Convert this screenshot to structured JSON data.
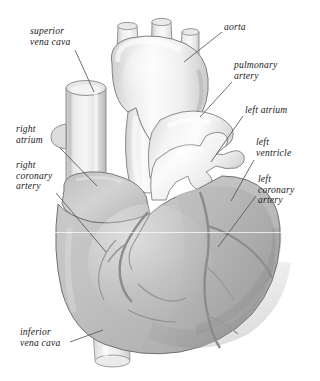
{
  "figure": {
    "view": "anterior",
    "style": "grayscale airbrush medical illustration",
    "background_color": "#ffffff",
    "label_color": "#1b1b1b",
    "leader_line_color": "#55555a"
  },
  "palette": {
    "background": "#ffffff",
    "vessel_highlight": "#fdfdfd",
    "vessel_light": "#f2f2f2",
    "vessel_mid": "#dcdcdc",
    "vessel_shadow": "#bdbdbd",
    "myocardium_light": "#cfcfcf",
    "myocardium_mid": "#bcbcbc",
    "myocardium_dark": "#a4a4a4",
    "outline": "#6f6f73",
    "groove": "#8f8f93"
  },
  "labels": [
    {
      "id": "superior-vena-cava",
      "lines": [
        "superior",
        "vena cava"
      ],
      "text": "superior vena cava",
      "side": "left",
      "x": 30,
      "y": 26,
      "leader": {
        "x1": 75,
        "y1": 50,
        "x2": 94,
        "y2": 92
      }
    },
    {
      "id": "right-atrium",
      "lines": [
        "right",
        "atrium"
      ],
      "text": "right atrium",
      "side": "left",
      "x": 16,
      "y": 124,
      "leader": {
        "x1": 60,
        "y1": 148,
        "x2": 97,
        "y2": 186
      }
    },
    {
      "id": "right-coronary-artery",
      "lines": [
        "right",
        "coronary",
        "artery"
      ],
      "text": "right coronary artery",
      "side": "left",
      "x": 16,
      "y": 160,
      "leader": {
        "x1": 56,
        "y1": 193,
        "x2": 106,
        "y2": 252
      }
    },
    {
      "id": "inferior-vena-cava",
      "lines": [
        "inferior",
        "vena cava"
      ],
      "text": "inferior vena cava",
      "side": "left",
      "x": 20,
      "y": 327,
      "leader": {
        "x1": 70,
        "y1": 342,
        "x2": 103,
        "y2": 330
      }
    },
    {
      "id": "aorta",
      "lines": [
        "aorta"
      ],
      "text": "aorta",
      "side": "right",
      "x": 224,
      "y": 22,
      "leader": {
        "x1": 222,
        "y1": 32,
        "x2": 184,
        "y2": 62
      }
    },
    {
      "id": "pulmonary-artery",
      "lines": [
        "pulmonary",
        "artery"
      ],
      "text": "pulmonary artery",
      "side": "right",
      "x": 234,
      "y": 60,
      "leader": {
        "x1": 232,
        "y1": 82,
        "x2": 200,
        "y2": 117
      }
    },
    {
      "id": "left-atrium",
      "lines": [
        "left atrium"
      ],
      "text": "left atrium",
      "side": "right",
      "x": 245,
      "y": 105,
      "leader": {
        "x1": 243,
        "y1": 116,
        "x2": 211,
        "y2": 162
      }
    },
    {
      "id": "left-ventricle",
      "lines": [
        "left",
        "ventricle"
      ],
      "text": "left ventricle",
      "side": "right",
      "x": 256,
      "y": 137,
      "leader": {
        "x1": 254,
        "y1": 160,
        "x2": 231,
        "y2": 201
      }
    },
    {
      "id": "left-coronary-artery",
      "lines": [
        "left",
        "coronary",
        "artery"
      ],
      "text": "left coronary artery",
      "side": "right",
      "x": 258,
      "y": 174,
      "leader": {
        "x1": 256,
        "y1": 196,
        "x2": 218,
        "y2": 247
      }
    }
  ],
  "structures": [
    {
      "id": "aortic-arch",
      "name": "aorta / aortic arch",
      "tone": "vessel_light"
    },
    {
      "id": "brachiocephalic-trunk",
      "name": "brachiocephalic trunk",
      "tone": "vessel_light"
    },
    {
      "id": "left-common-carotid",
      "name": "left common carotid artery",
      "tone": "vessel_light"
    },
    {
      "id": "left-subclavian",
      "name": "left subclavian artery",
      "tone": "vessel_light"
    },
    {
      "id": "superior-vena-cava-tube",
      "name": "superior vena cava",
      "tone": "vessel_mid"
    },
    {
      "id": "inferior-vena-cava-tube",
      "name": "inferior vena cava",
      "tone": "vessel_light"
    },
    {
      "id": "pulmonary-trunk",
      "name": "pulmonary artery / trunk",
      "tone": "vessel_light"
    },
    {
      "id": "left-atrium-body",
      "name": "left atrium with pulmonary veins",
      "tone": "vessel_light"
    },
    {
      "id": "right-atrium-body",
      "name": "right atrium",
      "tone": "myocardium_light"
    },
    {
      "id": "right-ventricle-body",
      "name": "right ventricle",
      "tone": "myocardium_mid"
    },
    {
      "id": "left-ventricle-body",
      "name": "left ventricle",
      "tone": "myocardium_dark"
    },
    {
      "id": "right-coronary-vessel",
      "name": "right coronary artery",
      "tone": "groove"
    },
    {
      "id": "left-coronary-vessel",
      "name": "left coronary artery / LAD",
      "tone": "groove"
    }
  ]
}
